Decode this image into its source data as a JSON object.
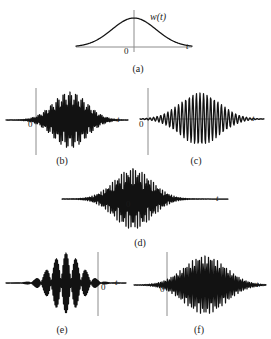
{
  "figure": {
    "title": "",
    "background_color": "#ffffff",
    "curve_color": "#121212",
    "axis_color": "#8c8c8c",
    "width": 271,
    "height": 339
  },
  "labels": {
    "t_axis": "t",
    "zero": "0",
    "window_function": "w(t)"
  },
  "panels": [
    {
      "id": "a",
      "caption": "(a)",
      "caption_x": 138,
      "caption_y": 64,
      "kind": "gaussian-window",
      "axis": {
        "x_start": 76,
        "x_end": 192,
        "y": 47,
        "v_x": 134,
        "v_y_top": 10,
        "v_y_bottom": 52
      },
      "t_label": {
        "x": 186,
        "y": 41
      },
      "zero_label": {
        "x": 124,
        "y": 48
      },
      "fn_label": {
        "x": 150,
        "y": 11,
        "text": "w(t)"
      },
      "envelope": {
        "amplitude": 29,
        "sigma": 22,
        "center": 134,
        "baseline": 47
      },
      "oscillations": 0
    },
    {
      "id": "b",
      "caption": "(b)",
      "caption_x": 62,
      "caption_y": 156,
      "kind": "wavelet",
      "axis": {
        "x_start": 6,
        "x_end": 128,
        "y": 120,
        "v_x": 36,
        "v_y_top": 88,
        "v_y_bottom": 155
      },
      "t_label": {
        "x": 117,
        "y": 114
      },
      "zero_label": {
        "x": 28,
        "y": 121
      },
      "envelope": {
        "amplitude": 28,
        "sigma": 17,
        "center": 70,
        "baseline": 120
      },
      "oscillations": 7,
      "frequency": 0.72,
      "phase": 0
    },
    {
      "id": "c",
      "caption": "(c)",
      "caption_x": 196,
      "caption_y": 156,
      "kind": "wavelet",
      "axis": {
        "x_start": 140,
        "x_end": 264,
        "y": 119,
        "v_x": 148,
        "v_y_top": 88,
        "v_y_bottom": 155
      },
      "t_label": {
        "x": 252,
        "y": 113
      },
      "zero_label": {
        "x": 139,
        "y": 121
      },
      "envelope": {
        "amplitude": 26,
        "sigma": 20,
        "center": 200,
        "baseline": 119
      },
      "oscillations": 3,
      "frequency": 0.28,
      "phase": 0
    },
    {
      "id": "d",
      "caption": "(d)",
      "caption_x": 140,
      "caption_y": 238,
      "kind": "wavelet",
      "axis": {
        "x_start": 62,
        "x_end": 228,
        "y": 199,
        "v_x": 133,
        "v_y_top": 168,
        "v_y_bottom": 208
      },
      "t_label": {
        "x": 216,
        "y": 193
      },
      "zero_label": {
        "x": 126,
        "y": 201
      },
      "envelope": {
        "amplitude": 30,
        "sigma": 19,
        "center": 133,
        "baseline": 199
      },
      "oscillations": 8,
      "frequency": 0.78,
      "phase": 0
    },
    {
      "id": "e",
      "caption": "(e)",
      "caption_x": 62,
      "caption_y": 325,
      "kind": "wavelet",
      "axis": {
        "x_start": 6,
        "x_end": 126,
        "y": 283,
        "v_x": 98,
        "v_y_top": 252,
        "v_y_bottom": 316
      },
      "t_label": {
        "x": 115,
        "y": 277
      },
      "zero_label": {
        "x": 101,
        "y": 284
      },
      "envelope": {
        "amplitude": 30,
        "sigma": 15,
        "center": 66,
        "baseline": 283
      },
      "oscillations": 9,
      "frequency": 0.95,
      "phase": 0
    },
    {
      "id": "f",
      "caption": "(f)",
      "caption_x": 199,
      "caption_y": 325,
      "kind": "wavelet",
      "axis": {
        "x_start": 134,
        "x_end": 266,
        "y": 285,
        "v_x": 167,
        "v_y_top": 252,
        "v_y_bottom": 316
      },
      "t_label": {
        "x": 256,
        "y": 279
      },
      "zero_label": {
        "x": 160,
        "y": 286
      },
      "envelope": {
        "amplitude": 29,
        "sigma": 21,
        "center": 205,
        "baseline": 285
      },
      "oscillations": 6,
      "frequency": 0.56,
      "phase": 0
    }
  ],
  "chart_data": {
    "type": "line",
    "xlabel": "t",
    "ylabel": "",
    "grid": false,
    "legend": "none",
    "series": [
      {
        "name": "(a) w(t) Gaussian window",
        "description": "Gaussian envelope, no oscillation, peak at t = 0",
        "amplitude": 1.0,
        "sigma": 22,
        "frequency": 0.0,
        "center_offset": 0
      },
      {
        "name": "(b) wavelet, medium frequency, shifted right of origin",
        "amplitude": 1.0,
        "sigma": 17,
        "frequency": 0.72,
        "center_offset": 34,
        "cycles": 7
      },
      {
        "name": "(c) wavelet, low frequency, shifted right of origin",
        "amplitude": 0.93,
        "sigma": 20,
        "frequency": 0.28,
        "center_offset": 52,
        "cycles": 3
      },
      {
        "name": "(d) wavelet, medium-high frequency, centered at origin",
        "amplitude": 1.07,
        "sigma": 19,
        "frequency": 0.78,
        "center_offset": 0,
        "cycles": 8
      },
      {
        "name": "(e) wavelet, high frequency, shifted left of origin",
        "amplitude": 1.07,
        "sigma": 15,
        "frequency": 0.95,
        "center_offset": -32,
        "cycles": 9
      },
      {
        "name": "(f) wavelet, medium-low frequency, shifted right of origin",
        "amplitude": 1.04,
        "sigma": 21,
        "frequency": 0.56,
        "center_offset": 38,
        "cycles": 6
      }
    ]
  }
}
